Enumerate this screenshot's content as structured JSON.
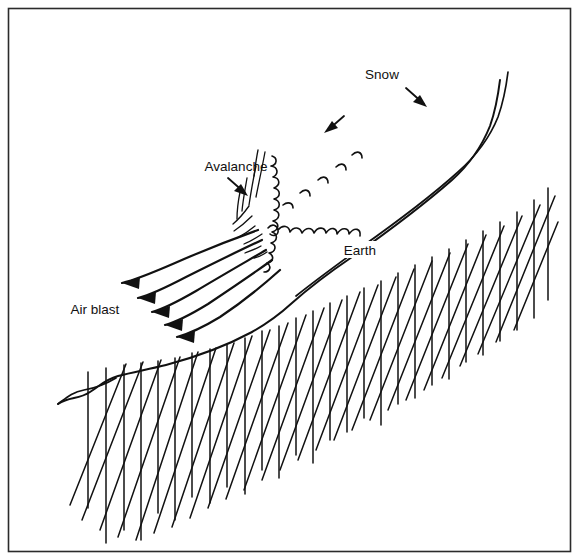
{
  "figure": {
    "title": "Avalanche air blast cross-section diagram",
    "background_color": "#ffffff",
    "ink_color": "#111111",
    "frame_color": "#2b2b2b",
    "width": 579,
    "height": 560
  },
  "labels": {
    "snow": "Snow",
    "avalanche": "Avalanche",
    "earth": "Earth",
    "air_blast": "Air blast"
  },
  "annotations": {
    "snow_leader": "leader-line-to-snow-layer",
    "avalanche_leader": "leader-line-to-avalanche-head",
    "motion_arrow": "avalanche-direction-arrow",
    "air_blast_arrow_count": 5
  },
  "elements": {
    "ground_surface": "earth-slope-profile",
    "snow_layer": "snow-mantle-band",
    "earth_body": "hatched-earth-cross-section",
    "avalanche_head": "turbulent-snow-cloud",
    "air_blast_streamlines": "five-curved-flow-lines"
  }
}
